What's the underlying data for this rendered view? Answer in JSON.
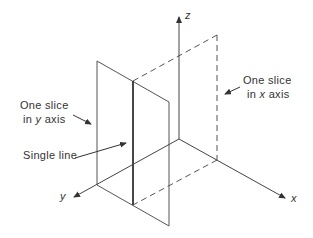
{
  "diagram": {
    "axes": {
      "x_label": "x",
      "y_label": "y",
      "z_label": "z"
    },
    "annotations": {
      "y_slice": {
        "line1": "One slice",
        "line2_prefix": "in ",
        "line2_axis": "y",
        "line2_suffix": " axis"
      },
      "x_slice": {
        "line1": "One slice",
        "line2_prefix": "in ",
        "line2_axis": "x",
        "line2_suffix": " axis"
      },
      "single_line": "Single line"
    },
    "colors": {
      "stroke": "#444444",
      "text": "#333333",
      "background": "#ffffff"
    }
  }
}
